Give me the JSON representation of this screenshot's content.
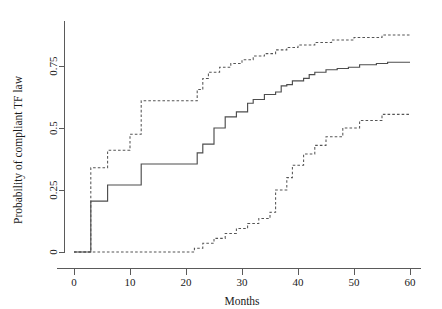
{
  "chart_data": {
    "type": "line",
    "title": "",
    "xlabel": "Months",
    "ylabel": "Probability of compliant TF law",
    "xlim": [
      -3,
      62
    ],
    "ylim": [
      0,
      0.93
    ],
    "xticks": [
      0,
      10,
      20,
      30,
      40,
      50,
      60
    ],
    "xtick_labels": [
      "0",
      "10",
      "20",
      "30",
      "40",
      "50",
      "60"
    ],
    "yticks": [
      0,
      0.25,
      0.5,
      0.75
    ],
    "ytick_labels": [
      "0",
      "0.25",
      "0.5",
      "0.75"
    ],
    "grid": false,
    "legend": "none",
    "step_interpolation": "hv",
    "series": [
      {
        "name": "Cumulative probability of compliant TF law",
        "style": "solid",
        "color": "#4d4d4d",
        "x": [
          0,
          3,
          3,
          6,
          6,
          12,
          12,
          22,
          22,
          23,
          23,
          24,
          24,
          25,
          25,
          27,
          27,
          29,
          29,
          31,
          31,
          32,
          32,
          34,
          34,
          36,
          36,
          37,
          37,
          38,
          38,
          39,
          39,
          41,
          41,
          42,
          42,
          43,
          43,
          45,
          45,
          47,
          47,
          49,
          49,
          51,
          51,
          54,
          54,
          56,
          56,
          60
        ],
        "y": [
          0,
          0,
          0.205,
          0.205,
          0.27,
          0.27,
          0.355,
          0.355,
          0.4,
          0.4,
          0.435,
          0.435,
          0.435,
          0.435,
          0.5,
          0.5,
          0.545,
          0.545,
          0.565,
          0.565,
          0.6,
          0.6,
          0.615,
          0.615,
          0.635,
          0.635,
          0.645,
          0.645,
          0.67,
          0.67,
          0.675,
          0.675,
          0.69,
          0.69,
          0.7,
          0.7,
          0.715,
          0.715,
          0.725,
          0.725,
          0.735,
          0.735,
          0.74,
          0.74,
          0.745,
          0.745,
          0.755,
          0.755,
          0.76,
          0.76,
          0.765,
          0.765
        ]
      },
      {
        "name": "Upper 95% confidence limit",
        "style": "dashed",
        "color": "#555555",
        "x": [
          0,
          3,
          3,
          6,
          6,
          10,
          10,
          12,
          12,
          22,
          22,
          23,
          23,
          24,
          24,
          26,
          26,
          28,
          28,
          30,
          30,
          32,
          32,
          34,
          34,
          36,
          36,
          38,
          38,
          40,
          40,
          43,
          43,
          46,
          46,
          50,
          50,
          55,
          55,
          60
        ],
        "y": [
          0,
          0,
          0.34,
          0.34,
          0.41,
          0.41,
          0.475,
          0.475,
          0.61,
          0.61,
          0.655,
          0.655,
          0.7,
          0.7,
          0.725,
          0.725,
          0.745,
          0.745,
          0.76,
          0.76,
          0.775,
          0.775,
          0.79,
          0.79,
          0.8,
          0.8,
          0.815,
          0.815,
          0.825,
          0.825,
          0.835,
          0.835,
          0.845,
          0.845,
          0.855,
          0.855,
          0.865,
          0.865,
          0.875,
          0.875
        ]
      },
      {
        "name": "Lower 95% confidence limit",
        "style": "dashed",
        "color": "#555555",
        "x": [
          0,
          21.5,
          21.5,
          23,
          23,
          25,
          25,
          27,
          27,
          29,
          29,
          31,
          31,
          33,
          33,
          35,
          35,
          36,
          36,
          38,
          38,
          39,
          39,
          41,
          41,
          43,
          43,
          45,
          45,
          48,
          48,
          51,
          51,
          55,
          55,
          60
        ],
        "y": [
          0,
          0,
          0.015,
          0.015,
          0.035,
          0.035,
          0.055,
          0.055,
          0.075,
          0.075,
          0.095,
          0.095,
          0.115,
          0.115,
          0.135,
          0.135,
          0.16,
          0.16,
          0.25,
          0.25,
          0.3,
          0.3,
          0.35,
          0.35,
          0.395,
          0.395,
          0.43,
          0.43,
          0.465,
          0.465,
          0.5,
          0.5,
          0.53,
          0.53,
          0.555,
          0.555
        ]
      }
    ]
  }
}
